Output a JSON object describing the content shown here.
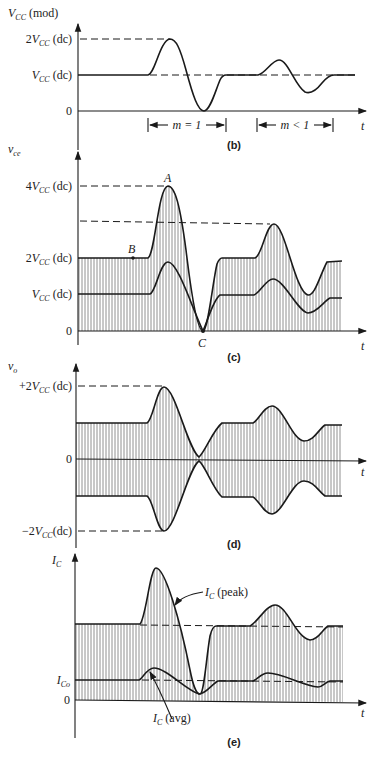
{
  "panels": {
    "b": {
      "caption": "(b)",
      "y_axis_label": "V",
      "y_axis_sub": "CC",
      "y_axis_suffix": " (mod)",
      "x_axis_label": "t",
      "ticks": [
        {
          "pre": "2",
          "sym": "V",
          "sub": "CC",
          "suf": " (dc)"
        },
        {
          "pre": "",
          "sym": "V",
          "sub": "CC",
          "suf": " (dc)"
        },
        {
          "pre": "0",
          "sym": "",
          "sub": "",
          "suf": ""
        }
      ],
      "interval_1": "m = 1",
      "interval_2": "m < 1"
    },
    "c": {
      "caption": "(c)",
      "y_axis_label": "v",
      "y_axis_sub": "ce",
      "x_axis_label": "t",
      "ticks": [
        {
          "pre": "4",
          "sym": "V",
          "sub": "CC",
          "suf": " (dc)"
        },
        {
          "pre": "2",
          "sym": "V",
          "sub": "CC",
          "suf": " (dc)"
        },
        {
          "pre": "",
          "sym": "V",
          "sub": "CC",
          "suf": " (dc)"
        },
        {
          "pre": "0",
          "sym": "",
          "sub": "",
          "suf": ""
        }
      ],
      "point_a": "A",
      "point_b": "B",
      "point_c": "C"
    },
    "d": {
      "caption": "(d)",
      "y_axis_label": "v",
      "y_axis_sub": "o",
      "x_axis_label": "t",
      "ticks": [
        {
          "pre": "+2",
          "sym": "V",
          "sub": "CC",
          "suf": " (dc)"
        },
        {
          "pre": "0",
          "sym": "",
          "sub": "",
          "suf": ""
        },
        {
          "pre": "−2",
          "sym": "V",
          "sub": "CC",
          "suf": "(dc)"
        }
      ]
    },
    "e": {
      "caption": "(e)",
      "y_axis_label": "I",
      "y_axis_sub": "C",
      "x_axis_label": "t",
      "ticks": [
        {
          "pre": "",
          "sym": "I",
          "sub": "Co",
          "suf": ""
        },
        {
          "pre": "0",
          "sym": "",
          "sub": "",
          "suf": ""
        }
      ],
      "peak_label_sym": "I",
      "peak_label_sub": "C",
      "peak_label_suf": " (peak)",
      "avg_label_sym": "I",
      "avg_label_sub": "C",
      "avg_label_suf": " (avg)"
    }
  },
  "colors": {
    "ink": "#1a1a1a",
    "paper": "#ffffff"
  }
}
